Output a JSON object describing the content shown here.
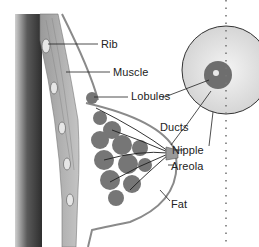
{
  "diagram": {
    "labels": {
      "rib": "Rib",
      "muscle": "Muscle",
      "lobules": "Lobules",
      "ducts": "Ducts",
      "nipple": "Nipple",
      "areola": "Areola",
      "fat": "Fat"
    },
    "colors": {
      "background": "#ffffff",
      "chest_wall_dark": "#4a4a4a",
      "muscle": "#a8a8a8",
      "tissue": "#7a7a7a",
      "outline": "#8c8c8c",
      "leader_line": "#222222"
    }
  }
}
